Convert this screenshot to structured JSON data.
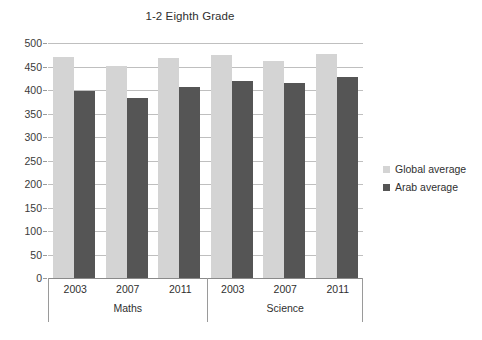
{
  "chart_data": {
    "type": "bar",
    "title": "1-2 Eighth Grade",
    "xlabel": "",
    "ylabel": "",
    "ylim": [
      0,
      500
    ],
    "ytick_step": 50,
    "yticks": [
      500,
      450,
      400,
      350,
      300,
      250,
      200,
      150,
      100,
      50,
      0
    ],
    "grid": "horizontal",
    "legend_position": "right",
    "group_labels": [
      "Maths",
      "Science"
    ],
    "categories": [
      "2003",
      "2007",
      "2011",
      "2003",
      "2007",
      "2011"
    ],
    "groups": [
      {
        "label": "Maths",
        "categories": [
          "2003",
          "2007",
          "2011"
        ]
      },
      {
        "label": "Science",
        "categories": [
          "2003",
          "2007",
          "2011"
        ]
      }
    ],
    "series": [
      {
        "name": "Global average",
        "color": "#d4d4d4",
        "values": [
          470,
          452,
          468,
          475,
          462,
          477
        ]
      },
      {
        "name": "Arab average",
        "color": "#555555",
        "values": [
          398,
          382,
          406,
          419,
          414,
          428
        ]
      }
    ]
  },
  "legend": {
    "items": [
      {
        "label": "Global average",
        "color": "#d4d4d4"
      },
      {
        "label": "Arab average",
        "color": "#555555"
      }
    ]
  }
}
